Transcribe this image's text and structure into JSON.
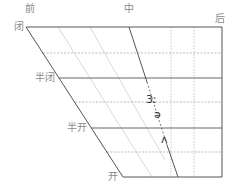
{
  "diagram": {
    "title": "",
    "column_labels": {
      "front": "前",
      "central": "中",
      "back": "后"
    },
    "row_labels": {
      "close": "闭",
      "close_mid": "半闭",
      "open_mid": "半开",
      "open": "开"
    },
    "vowels": [
      {
        "symbol": "3ː",
        "x": 147,
        "y": 94
      },
      {
        "symbol": "ə",
        "x": 155,
        "y": 110
      },
      {
        "symbol": "ʌ",
        "x": 162,
        "y": 135
      }
    ],
    "colors": {
      "frame": "#555555",
      "light_line": "#cccccc",
      "dashed_line": "#aaaaaa",
      "label_text": "#8a8a8a",
      "symbol_text": "#333333"
    }
  }
}
